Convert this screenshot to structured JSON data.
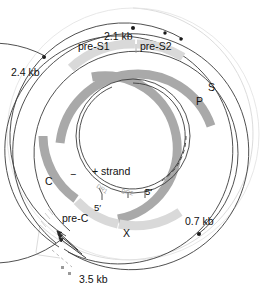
{
  "figure": {
    "type": "circular-genome-map"
  },
  "colors": {
    "gene_dark": "#a9a9a9",
    "gene_light": "#d9d9d9",
    "strand_line": "#3c3c3c",
    "outer_line": "#d8d8d8",
    "text": "#111111",
    "faint_text": "#9a9a9a",
    "background": "#ffffff"
  },
  "transcripts": [
    {
      "id": "t21",
      "label": "2.1 kb"
    },
    {
      "id": "t24",
      "label": "2.4 kb"
    },
    {
      "id": "t07",
      "label": "0.7 kb"
    },
    {
      "id": "t35",
      "label": "3.5 kb"
    }
  ],
  "genes": [
    {
      "id": "pre-s1",
      "label": "pre-S1",
      "shade": "light"
    },
    {
      "id": "pre-s2",
      "label": "pre-S2",
      "shade": "light"
    },
    {
      "id": "s",
      "label": "S",
      "shade": "dark"
    },
    {
      "id": "p",
      "label": "P",
      "shade": "dark"
    },
    {
      "id": "c",
      "label": "C",
      "shade": "dark"
    },
    {
      "id": "pre-c",
      "label": "pre-C",
      "shade": "light"
    },
    {
      "id": "x",
      "label": "X",
      "shade": "light"
    }
  ],
  "strands": {
    "plus_label": "+ strand",
    "minus_label": "−",
    "plus_five_prime": "5′",
    "minus_five_prime": "5′"
  },
  "direct_repeats": [
    {
      "id": "dr1",
      "label": "DR1"
    },
    {
      "id": "dr2",
      "label": "DR2"
    }
  ]
}
